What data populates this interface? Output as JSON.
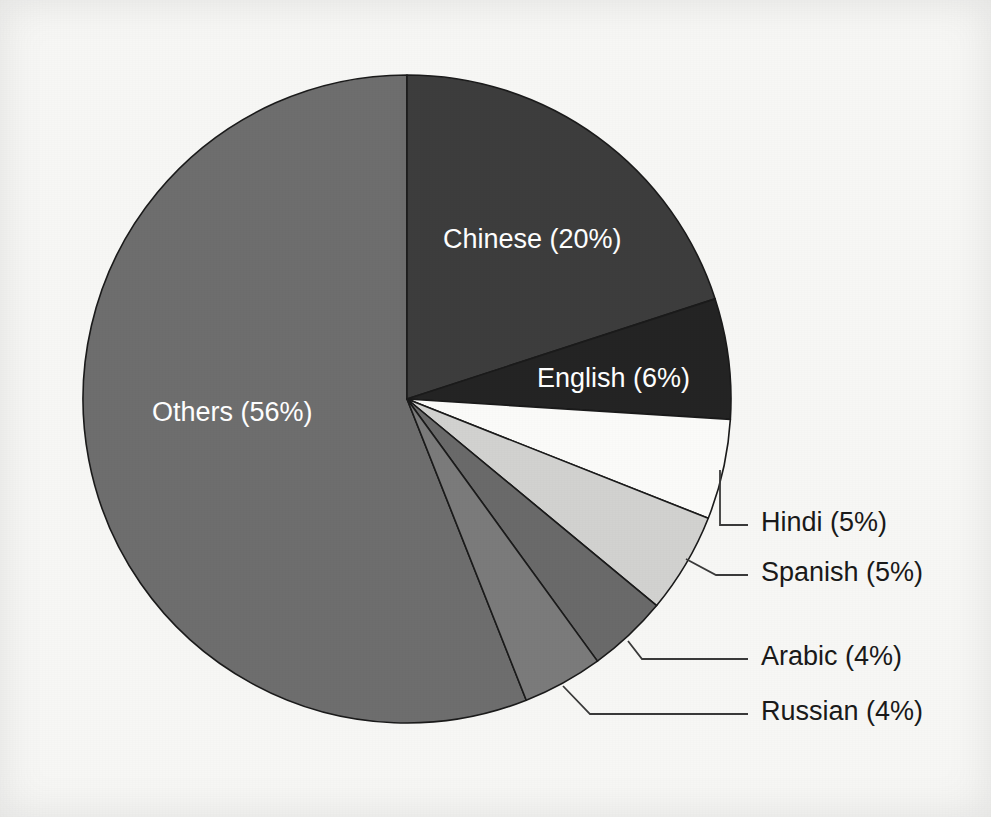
{
  "chart_data": {
    "type": "pie",
    "title": "",
    "subtitle": "",
    "xlabel": "",
    "ylabel": "",
    "legend_position": "none",
    "grid": false,
    "start_angle_deg": 0,
    "direction": "clockwise",
    "categories": [
      "Chinese",
      "English",
      "Hindi",
      "Spanish",
      "Arabic",
      "Russian",
      "Others"
    ],
    "values": [
      20,
      6,
      5,
      5,
      4,
      4,
      56
    ],
    "unit": "%",
    "slices": [
      {
        "name": "Chinese",
        "value": 20,
        "label": "Chinese (20%)",
        "color": "#3d3d3d",
        "label_placement": "inside",
        "label_color": "#ffffff"
      },
      {
        "name": "English",
        "value": 6,
        "label": "English (6%)",
        "color": "#242424",
        "label_placement": "inside",
        "label_color": "#ffffff"
      },
      {
        "name": "Hindi",
        "value": 5,
        "label": "Hindi (5%)",
        "color": "#fbfbf9",
        "label_placement": "outside",
        "label_color": "#1a1a1a"
      },
      {
        "name": "Spanish",
        "value": 5,
        "label": "Spanish (5%)",
        "color": "#d2d2d0",
        "label_placement": "outside",
        "label_color": "#1a1a1a"
      },
      {
        "name": "Arabic",
        "value": 4,
        "label": "Arabic (4%)",
        "color": "#6a6a6a",
        "label_placement": "outside",
        "label_color": "#1a1a1a"
      },
      {
        "name": "Russian",
        "value": 4,
        "label": "Russian (4%)",
        "color": "#7b7b7b",
        "label_placement": "outside",
        "label_color": "#1a1a1a"
      },
      {
        "name": "Others",
        "value": 56,
        "label": "Others (56%)",
        "color": "#6e6e6e",
        "label_placement": "inside",
        "label_color": "#ffffff"
      }
    ]
  },
  "figure": {
    "background_color": "#f7f7f5",
    "outline_color": "#1b1b1b",
    "leader_line_color": "#3a3a3a",
    "center_x": 407,
    "center_y": 399,
    "radius": 324
  },
  "labels": {
    "chinese": "Chinese (20%)",
    "english": "English (6%)",
    "hindi": "Hindi (5%)",
    "spanish": "Spanish (5%)",
    "arabic": "Arabic (4%)",
    "russian": "Russian (4%)",
    "others": "Others (56%)"
  }
}
